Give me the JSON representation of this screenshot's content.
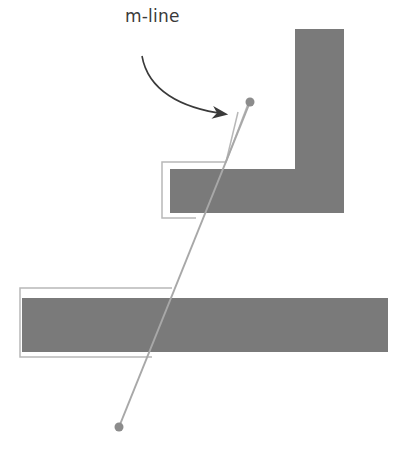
{
  "diagram": {
    "annotation_label": "m-line",
    "colors": {
      "obstacle_fill": "#7a7a7a",
      "outline_stroke": "#b8b8b8",
      "mline_stroke": "#a8a8a8",
      "point_fill": "#8c8c8c",
      "arrow_stroke": "#3a3a3a"
    },
    "start_point": {
      "x": 119,
      "y": 427
    },
    "goal_point": {
      "x": 250,
      "y": 102
    }
  }
}
